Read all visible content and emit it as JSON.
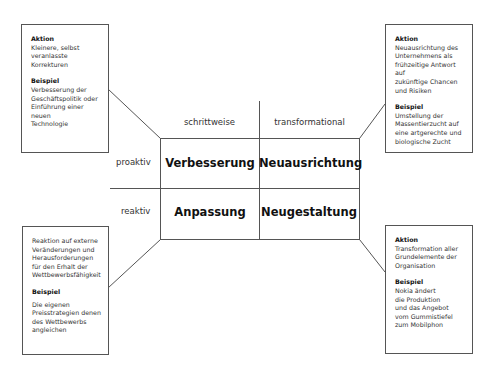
{
  "diagram": {
    "columns": [
      "schrittweise",
      "transformational"
    ],
    "rows": [
      "proaktiv",
      "reaktiv"
    ],
    "cells": {
      "proaktiv_schrittweise": "Verbesserung",
      "proaktiv_transformational": "Neuausrichtung",
      "reaktiv_schrittweise": "Anpassung",
      "reaktiv_transformational": "Neugestaltung"
    }
  },
  "boxes": {
    "top_left": {
      "action_label": "Aktion",
      "action_lines": [
        "Kleinere, selbst",
        "veranlasste Korrekturen"
      ],
      "example_label": "Beispiel",
      "example_lines": [
        "Verbesserung der",
        "Geschäftspolitik oder",
        "Einführung einer neuen",
        "Technologie"
      ]
    },
    "top_right": {
      "action_label": "Aktion",
      "action_lines": [
        "Neuausrichtung des",
        "Unternehmens als",
        "frühzeitige Antwort auf",
        "zukünftige Chancen",
        "und Risiken"
      ],
      "example_label": "Beispiel",
      "example_lines": [
        "Umstellung der",
        "Massentierzucht auf",
        "eine artgerechte und",
        "biologische Zucht"
      ]
    },
    "bottom_left": {
      "action_lines": [
        "Reaktion auf externe",
        "Veränderungen und",
        "Herausforderungen",
        "für den Erhalt der",
        "Wettbewerbsfähigkeit"
      ],
      "example_label": "Beispiel",
      "example_lines": [
        "Die eigenen",
        "Preisstrategien denen",
        "des Wettbewerbs",
        "angleichen"
      ]
    },
    "bottom_right": {
      "action_label": "Aktion",
      "action_lines": [
        "Transformation aller",
        "Grundelemente der",
        "Organisation"
      ],
      "example_label": "Beispiel",
      "example_lines": [
        "Nokia ändert",
        "die Produktion",
        "und das Angebot",
        "vom Gummistiefel",
        "zum Mobilphon"
      ]
    }
  }
}
